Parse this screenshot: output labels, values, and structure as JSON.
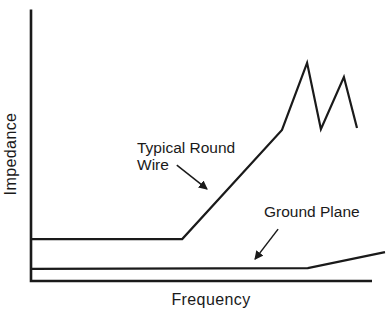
{
  "figure": {
    "ink_color": "#1a1a1a",
    "background_color": "#ffffff"
  },
  "chart_data": {
    "type": "line",
    "title": "",
    "xlabel": "Frequency",
    "ylabel": "Impedance",
    "xlim": [
      0,
      100
    ],
    "ylim": [
      0,
      100
    ],
    "units": "arbitrary (axes are unlabeled / qualitative)",
    "grid": false,
    "legend_position": "none (inline arrow annotations)",
    "x_ticks": [],
    "y_ticks": [],
    "series": [
      {
        "name": "Typical Round Wire",
        "points": [
          [
            0,
            15.1
          ],
          [
            42.7,
            15.1
          ],
          [
            70.9,
            55.4
          ],
          [
            78.0,
            80.1
          ],
          [
            81.9,
            55.7
          ],
          [
            88.4,
            74.9
          ],
          [
            92.1,
            56.1
          ]
        ]
      },
      {
        "name": "Ground Plane",
        "points": [
          [
            0,
            4.1
          ],
          [
            78.2,
            4.4
          ],
          [
            100,
            10.3
          ]
        ]
      }
    ],
    "annotations": [
      {
        "text": "Typical Round\nWire",
        "target": "rising segment of Typical Round Wire curve",
        "arrow": {
          "x1": 41.2,
          "y1": 42.4,
          "x2": 49.7,
          "y2": 33.6
        }
      },
      {
        "text": "Ground Plane",
        "target": "flat Ground Plane curve",
        "arrow": {
          "x1": 69.8,
          "y1": 18.8,
          "x2": 63.3,
          "y2": 7.7
        }
      }
    ]
  }
}
